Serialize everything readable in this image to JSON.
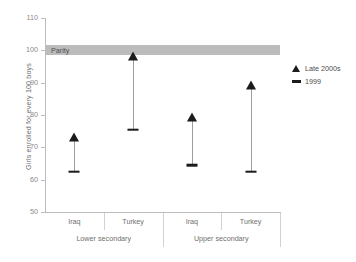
{
  "chart_data": {
    "type": "scatter",
    "title": "",
    "xlabel": "",
    "ylabel": "Girls enrolled for every 100 boys",
    "ylim": [
      50,
      110
    ],
    "yticks": [
      50,
      60,
      70,
      80,
      90,
      100,
      110
    ],
    "ytick_labels": [
      "50",
      "60",
      "70",
      "80",
      "90",
      "100",
      "110"
    ],
    "grid": false,
    "legend_position": "right",
    "categories": [
      "Iraq",
      "Turkey",
      "Iraq",
      "Turkey"
    ],
    "groups": [
      {
        "label": "Lower secondary",
        "categories": [
          "Iraq",
          "Turkey"
        ]
      },
      {
        "label": "Upper secondary",
        "categories": [
          "Iraq",
          "Turkey"
        ]
      }
    ],
    "series": [
      {
        "name": "Late 2000s",
        "marker": "triangle",
        "values": [
          73,
          98,
          79,
          89
        ]
      },
      {
        "name": "1999",
        "marker": "dash",
        "values": [
          62.5,
          75.5,
          64.5,
          62.5
        ]
      }
    ],
    "annotations": [
      {
        "label": "Parity",
        "value": 100,
        "type": "band",
        "band_range": [
          98.5,
          101.5
        ],
        "color": "#bcbcbc"
      }
    ],
    "colors": {
      "marker": "#1b1b1b",
      "range_line": "#9d9d9d",
      "axis": "#bdbdbd",
      "band": "#bcbcbc",
      "text": "#6f6f6f"
    }
  },
  "legend": {
    "items": [
      {
        "label": "Late 2000s",
        "marker": "triangle-icon"
      },
      {
        "label": "1999",
        "marker": "dash-icon"
      }
    ]
  }
}
